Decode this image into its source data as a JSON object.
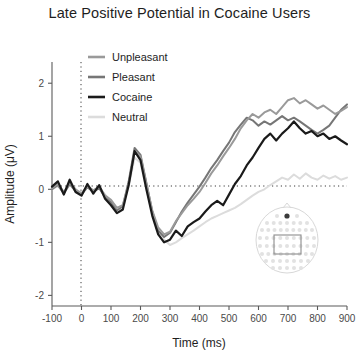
{
  "chart_data": {
    "type": "line",
    "title": "Late Positive Potential in Cocaine Users",
    "xlabel": "Time (ms)",
    "ylabel": "Amplitude (μV)",
    "xlim": [
      -100,
      900
    ],
    "ylim": [
      -2.2,
      2.4
    ],
    "xticks": [
      -100,
      0,
      100,
      200,
      300,
      400,
      500,
      600,
      700,
      800,
      900
    ],
    "xticklabels": [
      "-100",
      "0",
      "100",
      "200",
      "300",
      "400",
      "500",
      "600",
      "700",
      "800",
      "900"
    ],
    "yticks": [
      2,
      1,
      0,
      -1,
      -2
    ],
    "yticklabels": [
      "2",
      "1",
      "0",
      "-1",
      "-2"
    ],
    "grid": false,
    "zero_hline": 0,
    "stimulus_onset_vline": 0,
    "legend_position": "upper-left-inside",
    "x": [
      -100,
      -80,
      -60,
      -40,
      -20,
      0,
      20,
      40,
      60,
      80,
      100,
      120,
      140,
      160,
      180,
      200,
      220,
      240,
      260,
      280,
      300,
      320,
      340,
      360,
      380,
      400,
      420,
      440,
      460,
      480,
      500,
      520,
      540,
      560,
      580,
      600,
      620,
      640,
      660,
      680,
      700,
      720,
      740,
      760,
      780,
      800,
      820,
      840,
      860,
      880,
      900
    ],
    "series": [
      {
        "name": "Unpleasant",
        "color": "#9a9a9a",
        "linewidth": 2.0,
        "values": [
          0.02,
          0.1,
          -0.05,
          0.12,
          0.0,
          -0.08,
          0.06,
          -0.02,
          0.05,
          -0.12,
          -0.2,
          -0.35,
          -0.3,
          0.1,
          0.7,
          0.62,
          0.1,
          -0.4,
          -0.72,
          -0.85,
          -0.8,
          -0.6,
          -0.45,
          -0.3,
          -0.18,
          -0.05,
          0.12,
          0.3,
          0.45,
          0.62,
          0.78,
          0.95,
          1.15,
          1.3,
          1.42,
          1.35,
          1.45,
          1.5,
          1.42,
          1.55,
          1.68,
          1.72,
          1.62,
          1.68,
          1.6,
          1.52,
          1.58,
          1.5,
          1.42,
          1.48,
          1.55
        ]
      },
      {
        "name": "Pleasant",
        "color": "#767676",
        "linewidth": 2.0,
        "values": [
          0.0,
          0.08,
          -0.08,
          0.1,
          -0.04,
          -0.1,
          0.04,
          -0.05,
          0.02,
          -0.15,
          -0.25,
          -0.4,
          -0.32,
          0.15,
          0.78,
          0.65,
          0.12,
          -0.42,
          -0.78,
          -0.9,
          -0.82,
          -0.62,
          -0.42,
          -0.25,
          -0.1,
          0.05,
          0.22,
          0.4,
          0.55,
          0.72,
          0.88,
          1.08,
          1.22,
          1.35,
          1.3,
          1.2,
          1.28,
          1.22,
          1.3,
          1.38,
          1.3,
          1.35,
          1.28,
          1.2,
          1.12,
          1.05,
          1.12,
          1.2,
          1.35,
          1.5,
          1.6
        ]
      },
      {
        "name": "Cocaine",
        "color": "#1a1a1a",
        "linewidth": 2.2,
        "values": [
          0.05,
          0.15,
          -0.1,
          0.18,
          -0.05,
          -0.12,
          0.1,
          -0.08,
          0.08,
          -0.18,
          -0.3,
          -0.45,
          -0.38,
          0.08,
          0.72,
          0.55,
          0.0,
          -0.5,
          -0.85,
          -1.0,
          -0.95,
          -0.78,
          -0.88,
          -0.7,
          -0.62,
          -0.55,
          -0.42,
          -0.3,
          -0.22,
          -0.3,
          -0.1,
          0.1,
          0.25,
          0.45,
          0.6,
          0.78,
          0.95,
          1.05,
          0.92,
          1.05,
          1.15,
          1.28,
          1.15,
          1.05,
          1.1,
          1.0,
          1.05,
          0.95,
          1.0,
          0.92,
          0.85
        ]
      },
      {
        "name": "Neutral",
        "color": "#dcdcdc",
        "linewidth": 2.0,
        "values": [
          0.0,
          0.06,
          -0.06,
          0.08,
          -0.02,
          -0.06,
          0.04,
          -0.03,
          0.04,
          -0.1,
          -0.22,
          -0.35,
          -0.3,
          0.05,
          0.6,
          0.5,
          0.0,
          -0.45,
          -0.8,
          -0.95,
          -1.05,
          -1.0,
          -0.92,
          -0.85,
          -0.78,
          -0.7,
          -0.62,
          -0.55,
          -0.5,
          -0.45,
          -0.4,
          -0.35,
          -0.28,
          -0.2,
          -0.12,
          -0.05,
          0.0,
          0.08,
          0.15,
          0.22,
          0.18,
          0.28,
          0.2,
          0.3,
          0.22,
          0.18,
          0.26,
          0.2,
          0.25,
          0.18,
          0.22
        ]
      }
    ],
    "inset": {
      "name": "eeg-electrode-montage",
      "description": "scalp electrode layout with highlighted centro-parietal region of interest",
      "highlight_color": "#3a3a3a",
      "roi_box_color": "#8d8d8d"
    }
  }
}
